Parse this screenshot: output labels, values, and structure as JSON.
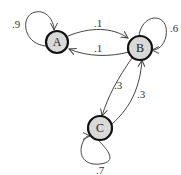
{
  "diagram": {
    "type": "markov-chain",
    "nodes": [
      {
        "id": "A",
        "label": "A",
        "fill": "#d9d9d9"
      },
      {
        "id": "B",
        "label": "B",
        "fill": "#d9d9d9"
      },
      {
        "id": "C",
        "label": "C",
        "fill": "#d9d9d9"
      }
    ],
    "edges": [
      {
        "from": "A",
        "to": "A",
        "label": ".9"
      },
      {
        "from": "A",
        "to": "B",
        "label": ".1"
      },
      {
        "from": "B",
        "to": "A",
        "label": ".1"
      },
      {
        "from": "B",
        "to": "B",
        "label": ".6"
      },
      {
        "from": "B",
        "to": "C",
        "label": ".3"
      },
      {
        "from": "C",
        "to": "B",
        "label": ".3"
      },
      {
        "from": "C",
        "to": "C",
        "label": ".7"
      }
    ]
  }
}
